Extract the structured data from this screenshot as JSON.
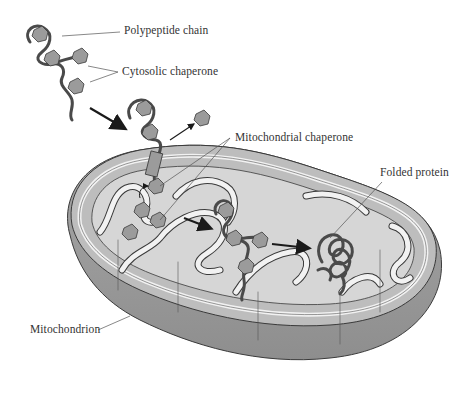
{
  "diagram": {
    "labels": {
      "polypeptide_chain": "Polypeptide chain",
      "cytosolic_chaperone": "Cytosolic chaperone",
      "mitochondrial_chaperone": "Mitochondrial chaperone",
      "folded_protein": "Folded protein",
      "mitochondrion": "Mitochondrion"
    },
    "colors": {
      "outer_shell": "#9a9a9a",
      "shell_dark": "#8c8c8c",
      "intermembrane": "#bdbdbd",
      "matrix": "#d6d6d6",
      "membrane_stroke": "#f2f2f2",
      "outline": "#3a3a3a",
      "chain": "#4a4a4a",
      "chaperone": "#9b9b9b",
      "text": "#333333"
    }
  }
}
